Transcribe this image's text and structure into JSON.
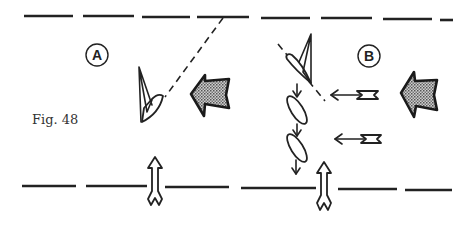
{
  "figure": {
    "caption": "Fig. 48",
    "panels": [
      {
        "id": "A",
        "label": "A"
      },
      {
        "id": "B",
        "label": "B"
      }
    ],
    "icons": {
      "wind_arrow": "stippled-wind-arrow",
      "current_arrow": "fletched-arrow",
      "boat": "sailboat",
      "hull": "boat-hull"
    },
    "colors": {
      "ink": "#222222",
      "background": "#ffffff",
      "stipple": "#9a9a9a"
    }
  }
}
